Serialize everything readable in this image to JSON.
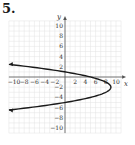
{
  "problem": {
    "number": "5."
  },
  "chart_data": {
    "type": "line",
    "title": "",
    "xlabel": "x",
    "ylabel": "y",
    "xlim": [
      -11,
      11
    ],
    "ylim": [
      -11,
      11
    ],
    "grid": true,
    "x_tick_labels": [
      "-10",
      "-8",
      "-6",
      "-4",
      "-2",
      "2",
      "4",
      "6",
      "8",
      "10"
    ],
    "y_tick_labels": [
      "10",
      "8",
      "6",
      "4",
      "2",
      "-2",
      "-4",
      "-6",
      "-8",
      "-10"
    ],
    "equation": "x = -(y + 2)^2 + 9",
    "vertex": [
      9,
      -2
    ],
    "y_intercepts": [
      1,
      -5
    ],
    "x_intercept": [
      5,
      0
    ],
    "series": [
      {
        "name": "parabola",
        "points": [
          [
            -11,
            2.47
          ],
          [
            -8,
            2.12
          ],
          [
            -5,
            1.74
          ],
          [
            0,
            1
          ],
          [
            5,
            0
          ],
          [
            8,
            -1
          ],
          [
            9,
            -2
          ],
          [
            8,
            -3
          ],
          [
            5,
            -4
          ],
          [
            0,
            -5
          ],
          [
            -5,
            -5.74
          ],
          [
            -8,
            -6.12
          ],
          [
            -11,
            -6.47
          ]
        ],
        "arrows": "both ends (left)",
        "color": "#1a1a1a"
      }
    ]
  }
}
